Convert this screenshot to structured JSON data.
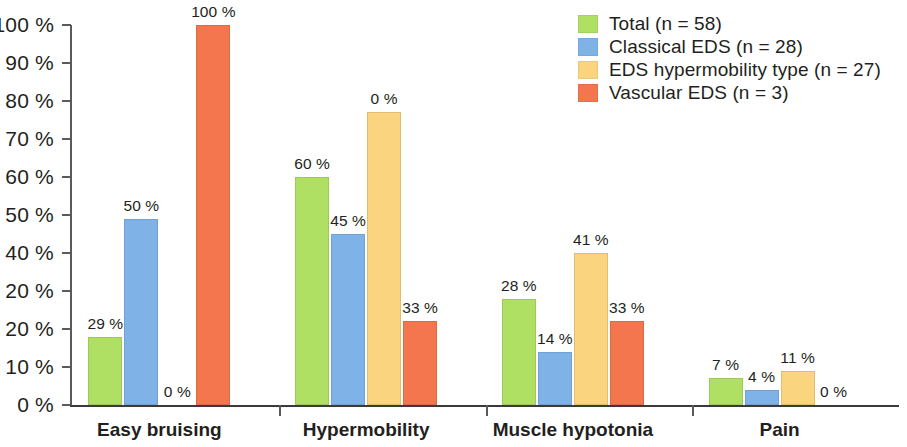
{
  "chart_data": {
    "type": "bar",
    "title": "",
    "subtitle": "",
    "xlabel": "",
    "ylabel": "",
    "ylim": [
      0,
      100
    ],
    "grid": false,
    "legend_position": "top-right",
    "categories": [
      "Easy bruising",
      "Hypermobility",
      "Muscle hypotonia",
      "Pain"
    ],
    "y_tick_labels": [
      "100 %",
      "90 %",
      "80 %",
      "70 %",
      "60 %",
      "50 %",
      "40 %",
      "20 %",
      "20 %",
      "10 %",
      "0 %"
    ],
    "y_tick_positions": [
      100,
      90,
      80,
      70,
      60,
      50,
      40,
      30,
      20,
      10,
      0
    ],
    "series": [
      {
        "name": "Total (n = 58)",
        "color": "#b0e063",
        "values": [
          29,
          60,
          28,
          7
        ],
        "plotted_heights": [
          18,
          60,
          28,
          7
        ],
        "labels": [
          "29 %",
          "60 %",
          "28 %",
          "7 %"
        ]
      },
      {
        "name": "Classical EDS (n = 28)",
        "color": "#7fb3e8",
        "values": [
          50,
          45,
          14,
          4
        ],
        "plotted_heights": [
          49,
          45,
          14,
          4
        ],
        "labels": [
          "50 %",
          "45 %",
          "14 %",
          "4 %"
        ]
      },
      {
        "name": "EDS hypermobility type (n = 27)",
        "color": "#fad47e",
        "values": [
          0,
          0,
          41,
          11
        ],
        "plotted_heights": [
          0,
          77,
          40,
          9
        ],
        "labels": [
          "0 %",
          "0 %",
          "41 %",
          "11 %"
        ]
      },
      {
        "name": "Vascular EDS (n = 3)",
        "color": "#f4764f",
        "values": [
          100,
          33,
          33,
          0
        ],
        "plotted_heights": [
          100,
          22,
          22,
          0
        ],
        "labels": [
          "100 %",
          "33 %",
          "33 %",
          "0 %"
        ]
      }
    ]
  },
  "legend": {
    "entries": [
      {
        "label": "Total (n = 58)",
        "color": "#b0e063"
      },
      {
        "label": "Classical EDS (n = 28)",
        "color": "#7fb3e8"
      },
      {
        "label": "EDS hypermobility type (n = 27)",
        "color": "#fad47e"
      },
      {
        "label": "Vascular EDS (n = 3)",
        "color": "#f4764f"
      }
    ]
  },
  "axis": {
    "axis_color": "#5a5a5a",
    "baseline_color": "#3a3a3a"
  }
}
